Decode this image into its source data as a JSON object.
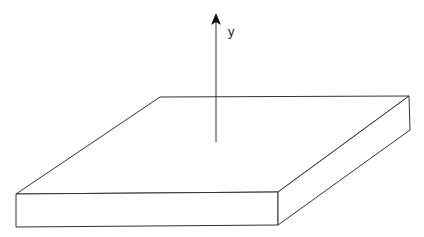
{
  "diagram": {
    "type": "isometric-slab-with-axis",
    "axis": {
      "label": "y",
      "direction": "up"
    },
    "colors": {
      "stroke": "#333333",
      "fill": "#ffffff",
      "background": "#ffffff"
    }
  }
}
